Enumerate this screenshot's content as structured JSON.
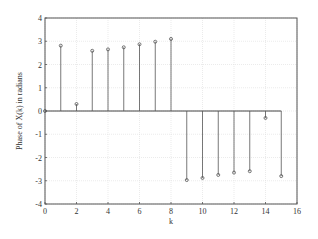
{
  "chart_data": {
    "type": "stem",
    "title": "",
    "xlabel": "k",
    "ylabel": "Phase of X(k) in radians",
    "xlim": [
      0,
      16
    ],
    "ylim": [
      -4,
      4
    ],
    "xticks": [
      0,
      2,
      4,
      6,
      8,
      10,
      12,
      14,
      16
    ],
    "yticks": [
      -4,
      -3,
      -2,
      -1,
      0,
      1,
      2,
      3,
      4
    ],
    "grid": true,
    "legend": null,
    "x": [
      0,
      1,
      2,
      3,
      4,
      5,
      6,
      7,
      8,
      9,
      10,
      11,
      12,
      13,
      14,
      15
    ],
    "y": [
      0,
      2.81,
      0.3,
      2.59,
      2.65,
      2.74,
      2.87,
      2.98,
      3.1,
      -2.97,
      -2.88,
      -2.75,
      -2.65,
      -2.59,
      -0.3,
      -2.8
    ],
    "marker": "circle",
    "stem_color": "#555555"
  },
  "style": {
    "axis_color": "#555555",
    "grid_color": "#dddddd",
    "stem_color": "#555555",
    "baseline_color": "#444444"
  }
}
